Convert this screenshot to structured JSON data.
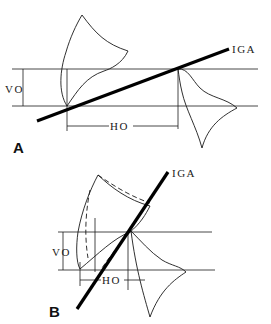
{
  "figure": {
    "panels": [
      {
        "id": "A",
        "label": "A",
        "axis_label": "IGA",
        "vertical_offset_label": "VO",
        "horizontal_offset_label": "HO",
        "description": "Two tooth outlines separated horizontally along the inclined IGA axis"
      },
      {
        "id": "B",
        "label": "B",
        "axis_label": "IGA",
        "vertical_offset_label": "VO",
        "horizontal_offset_label": "HO",
        "description": "Steeper IGA axis with overlapping tooth outlines and dashed alternate contour"
      }
    ],
    "colors": {
      "line": "#1a1a1a",
      "axis": "#000000",
      "background": "#ffffff"
    }
  }
}
